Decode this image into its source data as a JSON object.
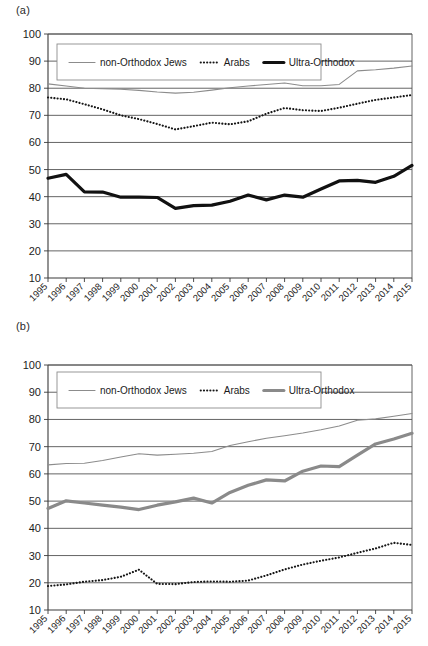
{
  "figure": {
    "panels": [
      {
        "id": "a",
        "label": "(a)"
      },
      {
        "id": "b",
        "label": "(b)"
      }
    ]
  },
  "chart_data": [
    {
      "type": "line",
      "panel": "(a)",
      "title": "",
      "subtitle": "",
      "xlabel": "",
      "ylabel": "",
      "grid": true,
      "legend_position": "top-inside",
      "ylim": [
        10,
        100
      ],
      "yticks": [
        10,
        20,
        30,
        40,
        50,
        60,
        70,
        80,
        90,
        100
      ],
      "categories": [
        "1995",
        "1996",
        "1997",
        "1998",
        "1999",
        "2000",
        "2001",
        "2002",
        "2003",
        "2004",
        "2005",
        "2006",
        "2007",
        "2008",
        "2009",
        "2010",
        "2011",
        "2012",
        "2013",
        "2014",
        "2015"
      ],
      "series": [
        {
          "name": "non-Orthodox Jews",
          "style": "thin-gray",
          "values": [
            81.6,
            80.8,
            80.0,
            79.8,
            79.6,
            79.2,
            78.6,
            78.2,
            78.5,
            79.3,
            80.2,
            80.8,
            81.4,
            81.9,
            80.9,
            80.9,
            81.4,
            86.4,
            86.8,
            87.4,
            88.2
          ]
        },
        {
          "name": "Arabs",
          "style": "dotted-black",
          "values": [
            76.6,
            75.9,
            74.1,
            72.2,
            70.0,
            68.6,
            66.8,
            64.8,
            66.0,
            67.3,
            66.7,
            67.8,
            70.6,
            72.7,
            71.9,
            71.6,
            72.8,
            74.3,
            75.7,
            76.6,
            77.5
          ]
        },
        {
          "name": "Ultra-Orthodox",
          "style": "thick-black",
          "values": [
            46.8,
            48.2,
            41.8,
            41.7,
            39.8,
            39.8,
            39.7,
            35.7,
            36.7,
            36.9,
            38.3,
            40.6,
            38.8,
            40.6,
            39.8,
            42.8,
            45.8,
            46.0,
            45.3,
            47.5,
            51.5
          ]
        }
      ]
    },
    {
      "type": "line",
      "panel": "(b)",
      "title": "",
      "subtitle": "",
      "xlabel": "",
      "ylabel": "",
      "grid": true,
      "legend_position": "top-inside",
      "ylim": [
        10,
        100
      ],
      "yticks": [
        10,
        20,
        30,
        40,
        50,
        60,
        70,
        80,
        90,
        100
      ],
      "categories": [
        "1995",
        "1996",
        "1997",
        "1998",
        "1999",
        "2000",
        "2001",
        "2002",
        "2003",
        "2004",
        "2005",
        "2006",
        "2007",
        "2008",
        "2009",
        "2010",
        "2011",
        "2012",
        "2013",
        "2014",
        "2015"
      ],
      "series": [
        {
          "name": "non-Orthodox Jews",
          "style": "thin-gray",
          "values": [
            63.3,
            63.8,
            63.9,
            64.9,
            66.2,
            67.4,
            66.9,
            67.2,
            67.6,
            68.2,
            70.4,
            71.8,
            73.1,
            74.0,
            75.0,
            76.2,
            77.6,
            79.7,
            80.2,
            81.2,
            82.2
          ]
        },
        {
          "name": "Arabs",
          "style": "dotted-black",
          "values": [
            18.8,
            19.4,
            20.4,
            21.0,
            22.2,
            24.8,
            19.6,
            19.5,
            20.3,
            20.5,
            20.4,
            20.8,
            22.7,
            24.9,
            26.7,
            28.1,
            29.3,
            31.0,
            32.6,
            34.7,
            33.9
          ]
        },
        {
          "name": "Ultra-Orthodox",
          "style": "thick-gray",
          "values": [
            47.3,
            50.1,
            49.3,
            48.5,
            47.8,
            46.9,
            48.5,
            49.7,
            51.1,
            49.3,
            53.2,
            55.8,
            57.8,
            57.4,
            61.0,
            62.9,
            62.7,
            66.9,
            71.0,
            72.8,
            74.9
          ]
        }
      ],
      "legend": [
        "non-Orthodox Jews",
        "Arabs",
        "Ultra-Orthodox"
      ]
    }
  ]
}
